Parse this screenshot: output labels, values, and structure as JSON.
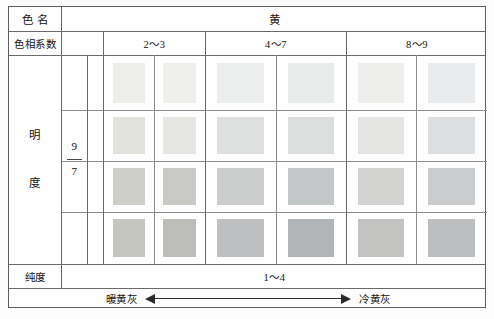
{
  "table": {
    "row_labels": {
      "color_name": "色  名",
      "hue_coefficient": "色相系数",
      "value_label_1": "明",
      "value_label_2": "度",
      "value_range_top": "9",
      "value_range_bottom": "7",
      "purity": "纯度"
    },
    "color_name_value": "黄",
    "hue_groups": [
      "2～3",
      "4～7",
      "8～9"
    ],
    "purity_value": "1～4",
    "axis": {
      "left_label": "暖黄灰",
      "right_label": "冷黄灰"
    }
  },
  "chart_data": {
    "type": "heatmap",
    "title": "黄",
    "subtitle": "色名 / 色相系数 / 明度 / 纯度 色卡表",
    "xlabel": "色相系数",
    "ylabel": "明度",
    "grid": true,
    "legend": "none",
    "categories": [
      "2～3 a",
      "2～3 b",
      "4～7 a",
      "4～7 b",
      "8～9 a",
      "8～9 b"
    ],
    "column_groups": [
      {
        "label": "2～3",
        "columns": 2
      },
      {
        "label": "4～7",
        "columns": 2
      },
      {
        "label": "8～9",
        "columns": 2
      }
    ],
    "row_labels": [
      "9",
      "8.3",
      "7.7",
      "7"
    ],
    "ylim": [
      7,
      9
    ],
    "purity_range": [
      1,
      4
    ],
    "annotations": [
      "暖黄灰",
      "冷黄灰"
    ],
    "swatch_colors": [
      [
        "#ededea",
        "#efefec",
        "#eceeee",
        "#eaecec",
        "#eeeeed",
        "#eaebec"
      ],
      [
        "#e3e3dd",
        "#e6e6e2",
        "#dfe1e1",
        "#dcdede",
        "#e5e5e4",
        "#dcdee0"
      ],
      [
        "#cfcfca",
        "#c9c9c6",
        "#cbcdcd",
        "#c4c7c8",
        "#d2d2d1",
        "#c9cbcd"
      ],
      [
        "#c6c6c1",
        "#bcbcb8",
        "#bdbfc0",
        "#b2b5b7",
        "#c3c3c2",
        "#bbbdbf"
      ]
    ],
    "swatch_values": [
      [
        {
          "v": 9,
          "c": 1
        },
        {
          "v": 9,
          "c": 1
        },
        {
          "v": 9,
          "c": 2
        },
        {
          "v": 9,
          "c": 2
        },
        {
          "v": 9,
          "c": 1
        },
        {
          "v": 9,
          "c": 2
        }
      ],
      [
        {
          "v": 8.3,
          "c": 2
        },
        {
          "v": 8.3,
          "c": 2
        },
        {
          "v": 8.3,
          "c": 3
        },
        {
          "v": 8.3,
          "c": 3
        },
        {
          "v": 8.3,
          "c": 2
        },
        {
          "v": 8.3,
          "c": 3
        }
      ],
      [
        {
          "v": 7.7,
          "c": 3
        },
        {
          "v": 7.7,
          "c": 3
        },
        {
          "v": 7.7,
          "c": 4
        },
        {
          "v": 7.7,
          "c": 4
        },
        {
          "v": 7.7,
          "c": 3
        },
        {
          "v": 7.7,
          "c": 4
        }
      ],
      [
        {
          "v": 7,
          "c": 3
        },
        {
          "v": 7,
          "c": 4
        },
        {
          "v": 7,
          "c": 4
        },
        {
          "v": 7,
          "c": 4
        },
        {
          "v": 7,
          "c": 3
        },
        {
          "v": 7,
          "c": 4
        }
      ]
    ]
  }
}
